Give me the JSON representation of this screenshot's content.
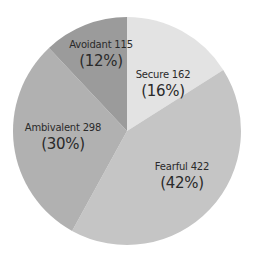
{
  "chart_data": {
    "type": "pie",
    "title": "",
    "start_angle_deg": 0,
    "direction": "clockwise",
    "center": [
      127,
      131
    ],
    "radius": 114,
    "slices": [
      {
        "label": "Secure",
        "value": 162,
        "percent": 16,
        "color": "#e3e3e3",
        "label_pos": [
          163,
          70
        ]
      },
      {
        "label": "Fearful",
        "value": 422,
        "percent": 42,
        "color": "#c5c5c5",
        "label_pos": [
          183,
          162
        ]
      },
      {
        "label": "Ambivalent",
        "value": 298,
        "percent": 30,
        "color": "#b1b1b1",
        "label_pos": [
          63,
          123
        ]
      },
      {
        "label": "Avoidant",
        "value": 115,
        "percent": 12,
        "color": "#9b9b9b",
        "label_pos": [
          100,
          40
        ]
      }
    ],
    "total": 997
  },
  "labels": {
    "secure": {
      "name": "Secure 162",
      "pct": "(16%)"
    },
    "fearful": {
      "name": "Fearful 422",
      "pct": "(42%)"
    },
    "ambivalent": {
      "name": "Ambivalent 298",
      "pct": "(30%)"
    },
    "avoidant": {
      "name": "Avoidant 115",
      "pct": "(12%)"
    }
  }
}
